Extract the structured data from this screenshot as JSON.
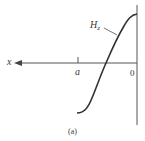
{
  "figure": {
    "caption": "(a)",
    "axis_labels": {
      "x": "x",
      "tick_a": "a",
      "origin": "0"
    },
    "curve_label": {
      "main": "H",
      "subscript": "z"
    },
    "colors": {
      "ink": "#333333",
      "background": "#ffffff"
    }
  }
}
